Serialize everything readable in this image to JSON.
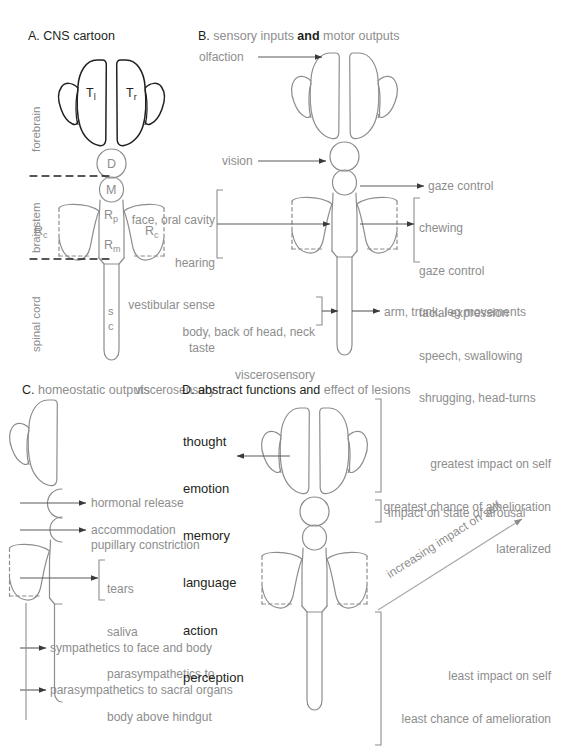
{
  "figure": {
    "caption_note": "Schematic cartoon of the central nervous system in four panels"
  },
  "colors": {
    "gray": "#8d8d8d",
    "dark": "#231f20",
    "outline_gray": "#8d8d8d",
    "outline_dark": "#231f20",
    "background": "#ffffff"
  },
  "panelA": {
    "letter": "A.",
    "title": " CNS cartoon",
    "side_labels": [
      "forebrain",
      "brainstem",
      "spinal cord"
    ],
    "structures": {
      "telencephalon_left": "T",
      "telencephalon_left_sub": "l",
      "telencephalon_right": "T",
      "telencephalon_right_sub": "r",
      "diencephalon": "D",
      "mesencephalon": "M",
      "pons": "R",
      "pons_sub": "p",
      "medulla": "R",
      "medulla_sub": "m",
      "cerebellum_left": "R",
      "cerebellum_left_sub": "c",
      "cerebellum_right": "R",
      "cerebellum_right_sub": "c",
      "spinal_cord_line1": "s",
      "spinal_cord_line2": "c"
    }
  },
  "panelB": {
    "letter": "B.",
    "title_gray_1": " sensory inputs ",
    "title_dark_2": "and",
    "title_gray_3": " motor outputs",
    "olfaction": "olfaction",
    "vision": "vision",
    "sensory_brainstem": [
      "face, oral cavity",
      "hearing",
      "vestibular sense",
      "taste",
      "viscerosensory"
    ],
    "motor_gaze": "gaze control",
    "motor_brainstem": [
      "chewing",
      "gaze control",
      "facial expression",
      "speech, swallowing",
      "shrugging, head-turns"
    ],
    "sensory_spinal": [
      "body, back of head, neck",
      "viscerosensory"
    ],
    "motor_spinal": "arm, trunk, leg movements"
  },
  "panelC": {
    "letter": "C.",
    "title": " homeostatic outputs",
    "outputs": [
      "hormonal release",
      "accommodation",
      "pupillary constriction",
      "sympathetics to face and body",
      "parasympathetics to sacral organs"
    ],
    "bracket_list": [
      "tears",
      "saliva",
      "parasympathetics to",
      "body above hindgut"
    ]
  },
  "panelD": {
    "letter": "D.",
    "title_dark": " abstract functions and",
    "title_gray": " effect of lesions",
    "functions": [
      "thought",
      "emotion",
      "memory",
      "language",
      "action",
      "perception"
    ],
    "forebrain_effects": [
      "greatest impact on self",
      "greatest chance of amelioration",
      "lateralized"
    ],
    "brainstem_effect": "impact on state of arousal",
    "diagonal_label": "increasing impact on self",
    "spinal_effects": [
      "least impact on self",
      "least chance of amelioration"
    ]
  }
}
